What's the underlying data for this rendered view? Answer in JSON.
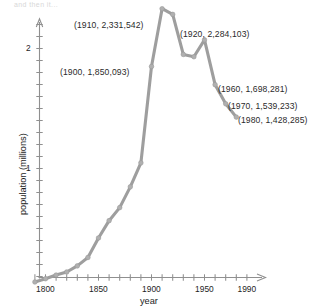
{
  "figure": {
    "faint_header": "and then it...",
    "axis_color": "#8f8f8f",
    "line_color": "#9e9e9e",
    "text_color": "#1d1d1d"
  },
  "axes": {
    "x": {
      "title": "year",
      "ticks": [
        1790,
        1800,
        1810,
        1820,
        1830,
        1840,
        1850,
        1860,
        1870,
        1880,
        1890,
        1900,
        1910,
        1920,
        1930,
        1940,
        1950,
        1960,
        1970,
        1980,
        1990
      ],
      "labeled_ticks": [
        {
          "value": 1800,
          "label": "1800"
        },
        {
          "value": 1850,
          "label": "1850"
        },
        {
          "value": 1900,
          "label": "1900"
        },
        {
          "value": 1950,
          "label": "1950"
        },
        {
          "value": 1990,
          "label": "1990"
        }
      ],
      "range": [
        1785,
        1998
      ],
      "arrow": true
    },
    "y": {
      "title": "population (millions)",
      "ticks": [
        0.1,
        0.2,
        0.3,
        0.4,
        0.5,
        0.6,
        0.7,
        0.8,
        0.9,
        1.0,
        1.1,
        1.2,
        1.3,
        1.4,
        1.5,
        1.6,
        1.7,
        1.8,
        1.9,
        2.0,
        2.1,
        2.2,
        2.3,
        2.4
      ],
      "labeled_ticks": [
        {
          "value": 1,
          "label": "1"
        },
        {
          "value": 2,
          "label": "2"
        }
      ],
      "range": [
        0,
        2.5
      ],
      "arrow": true
    }
  },
  "annotations": [
    {
      "id": "a1910",
      "text": "(1910,  2,331,542)",
      "x": 74,
      "y": 20
    },
    {
      "id": "a1920",
      "text": "(1920,  2,284,103)",
      "x": 180,
      "y": 29
    },
    {
      "id": "a1900",
      "text": "(1900,  1,850,093)",
      "x": 60,
      "y": 67
    },
    {
      "id": "a1960",
      "text": "(1960,  1,698,281)",
      "x": 218,
      "y": 84
    },
    {
      "id": "a1970",
      "text": "(1970,  1,539,233)",
      "x": 228,
      "y": 101
    },
    {
      "id": "a1980",
      "text": "(1980,  1,428,285)",
      "x": 238,
      "y": 115
    }
  ],
  "chart_data": {
    "type": "line",
    "title": "",
    "xlabel": "year",
    "ylabel": "population (millions)",
    "xlim": [
      1785,
      1998
    ],
    "ylim": [
      0,
      2.5
    ],
    "grid": false,
    "legend": false,
    "marker": "circle",
    "x": [
      1790,
      1800,
      1810,
      1820,
      1830,
      1840,
      1850,
      1860,
      1870,
      1880,
      1890,
      1900,
      1910,
      1920,
      1930,
      1940,
      1950,
      1960,
      1970,
      1980
    ],
    "values": [
      0.0544,
      0.0815,
      0.1119,
      0.1375,
      0.1885,
      0.2584,
      0.4212,
      0.5654,
      0.6741,
      0.847,
      1.0469,
      1.8501,
      2.3315,
      2.2841,
      1.9507,
      1.9313,
      2.0717,
      1.6983,
      1.5392,
      1.4283
    ],
    "labeled_points": [
      {
        "year": 1900,
        "population": 1850093,
        "label": "(1900,  1,850,093)"
      },
      {
        "year": 1910,
        "population": 2331542,
        "label": "(1910,  2,331,542)"
      },
      {
        "year": 1920,
        "population": 2284103,
        "label": "(1920,  2,284,103)"
      },
      {
        "year": 1960,
        "population": 1698281,
        "label": "(1960,  1,698,281)"
      },
      {
        "year": 1970,
        "population": 1539233,
        "label": "(1970,  1,539,233)"
      },
      {
        "year": 1980,
        "population": 1428285,
        "label": "(1980,  1,428,285)"
      }
    ]
  }
}
